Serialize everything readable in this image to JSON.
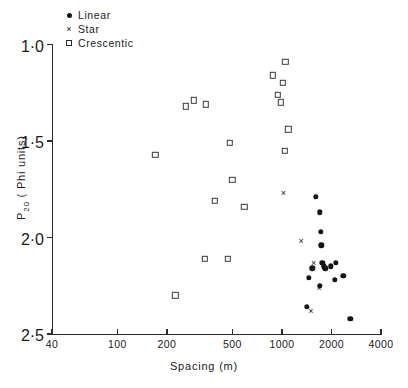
{
  "chart_data": {
    "type": "scatter",
    "title": "",
    "xlabel": "Spacing  (m)",
    "ylabel": "P20 ( Phi units)",
    "xscale": "log",
    "xlim": [
      40,
      4000
    ],
    "ylim": [
      1.0,
      2.5
    ],
    "y_inverted": true,
    "grid": false,
    "legend_position": "top-left",
    "xticks": [
      40,
      100,
      200,
      500,
      1000,
      2000,
      4000
    ],
    "xtick_labels": [
      "40",
      "100",
      "200",
      "500",
      "1000",
      "2000",
      "4000"
    ],
    "yticks": [
      1.0,
      1.5,
      2.0,
      2.5
    ],
    "ytick_labels": [
      "1·0",
      "1·5",
      "2·0",
      "2·5"
    ],
    "series": [
      {
        "name": "Linear",
        "marker": "filled-circle",
        "color": "#141414",
        "points": [
          [
            1610,
            1.79
          ],
          [
            1700,
            1.87
          ],
          [
            1720,
            1.97
          ],
          [
            1730,
            2.04
          ],
          [
            1530,
            2.16
          ],
          [
            1450,
            2.21
          ],
          [
            1755,
            2.13
          ],
          [
            1800,
            2.15
          ],
          [
            1830,
            2.16
          ],
          [
            1980,
            2.15
          ],
          [
            2130,
            2.13
          ],
          [
            2100,
            2.22
          ],
          [
            1700,
            2.25
          ],
          [
            1410,
            2.36
          ],
          [
            2360,
            2.2
          ],
          [
            2600,
            2.42
          ]
        ]
      },
      {
        "name": "Star",
        "marker": "x",
        "color": "#141414",
        "points": [
          [
            1020,
            1.77
          ],
          [
            1310,
            2.02
          ],
          [
            1560,
            2.13
          ],
          [
            1680,
            2.26
          ],
          [
            1500,
            2.38
          ]
        ]
      },
      {
        "name": "Crescentic",
        "marker": "open-square",
        "color": "#3a3a3a",
        "points": [
          [
            880,
            1.16
          ],
          [
            1050,
            1.09
          ],
          [
            1010,
            1.2
          ],
          [
            940,
            1.26
          ],
          [
            985,
            1.3
          ],
          [
            1090,
            1.44
          ],
          [
            1040,
            1.55
          ],
          [
            260,
            1.32
          ],
          [
            290,
            1.29
          ],
          [
            345,
            1.31
          ],
          [
            170,
            1.57
          ],
          [
            480,
            1.51
          ],
          [
            500,
            1.7
          ],
          [
            390,
            1.81
          ],
          [
            590,
            1.84
          ],
          [
            340,
            2.11
          ],
          [
            470,
            2.11
          ],
          [
            225,
            2.3
          ]
        ]
      }
    ]
  },
  "legend": {
    "items": [
      {
        "label": "Linear",
        "marker": "filled-circle"
      },
      {
        "label": "Star",
        "marker": "x"
      },
      {
        "label": "Crescentic",
        "marker": "open-square"
      }
    ]
  },
  "axes": {
    "y_title_main": "P",
    "y_title_sub": "20",
    "y_title_rest": " ( Phi units)",
    "x_title": "Spacing  (m)"
  }
}
